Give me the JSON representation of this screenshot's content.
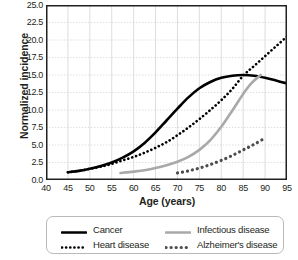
{
  "chart_data": {
    "type": "line",
    "title": "",
    "xlabel": "Age (years)",
    "ylabel": "Normalized incidence",
    "xlim": [
      40,
      95
    ],
    "ylim": [
      0.0,
      25.0
    ],
    "xticks": [
      "40",
      "45",
      "50",
      "55",
      "60",
      "65",
      "70",
      "75",
      "80",
      "85",
      "90",
      "95"
    ],
    "yticks": [
      "0.0",
      "2.5",
      "5.0",
      "7.5",
      "10.0",
      "12.5",
      "15.0",
      "17.5",
      "20.0",
      "22.5",
      "25.0"
    ],
    "grid": true,
    "legend_position": "below",
    "series": [
      {
        "name": "Cancer",
        "style": "solid",
        "color": "#000000",
        "width": 2.6,
        "x": [
          45,
          47.5,
          50,
          52.5,
          55,
          57.5,
          60,
          62.5,
          65,
          67.5,
          70,
          72.5,
          75,
          77.5,
          80,
          82.5,
          85,
          87.5,
          90,
          92.5,
          95
        ],
        "y": [
          1.1,
          1.3,
          1.6,
          2.0,
          2.5,
          3.2,
          4.1,
          5.3,
          6.8,
          8.5,
          10.2,
          11.8,
          13.1,
          14.0,
          14.6,
          14.9,
          15.0,
          14.9,
          14.6,
          14.2,
          13.8
        ]
      },
      {
        "name": "Heart disease",
        "style": "dotted",
        "color": "#000000",
        "width": 2.6,
        "x": [
          45,
          47.5,
          50,
          52.5,
          55,
          57.5,
          60,
          62.5,
          65,
          67.5,
          70,
          72.5,
          75,
          77.5,
          80,
          82.5,
          85,
          87.5,
          90,
          92.5,
          95
        ],
        "y": [
          1.1,
          1.3,
          1.6,
          1.9,
          2.3,
          2.8,
          3.3,
          3.9,
          4.6,
          5.4,
          6.4,
          7.5,
          8.7,
          10.0,
          11.4,
          13.0,
          14.9,
          16.3,
          17.7,
          19.1,
          20.5
        ]
      },
      {
        "name": "Infectious disease",
        "style": "solid",
        "color": "#a9a9a9",
        "width": 2.6,
        "x": [
          57,
          60,
          62.5,
          65,
          67.5,
          70,
          72.5,
          75,
          77.5,
          80,
          82.5,
          85,
          87,
          89
        ],
        "y": [
          1.0,
          1.2,
          1.4,
          1.7,
          2.1,
          2.6,
          3.3,
          4.3,
          5.7,
          7.6,
          9.9,
          12.3,
          13.9,
          15.0
        ]
      },
      {
        "name": "Alzheimer's disease",
        "style": "dotted",
        "color": "#4d4d4d",
        "width": 3.2,
        "x": [
          70,
          72.5,
          75,
          77.5,
          80,
          82.5,
          85,
          87.5,
          90
        ],
        "y": [
          1.0,
          1.3,
          1.7,
          2.2,
          2.8,
          3.5,
          4.3,
          5.1,
          6.0
        ]
      }
    ]
  },
  "legend": {
    "items": [
      {
        "label": "Cancer"
      },
      {
        "label": "Heart disease"
      },
      {
        "label": "Infectious disease"
      },
      {
        "label": "Alzheimer's disease"
      }
    ]
  }
}
